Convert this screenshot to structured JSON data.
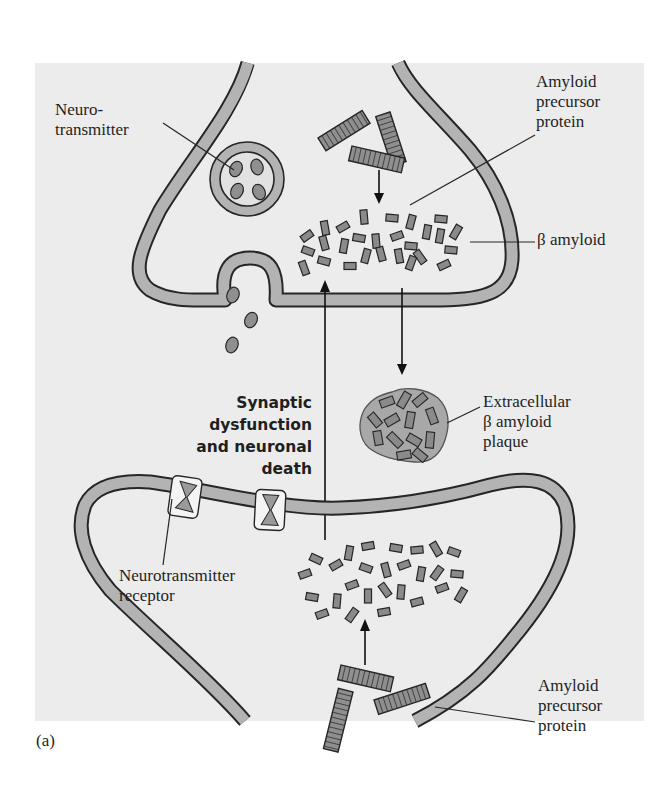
{
  "figure": {
    "panel_label": "(a)",
    "colors": {
      "background_panel": "#ececec",
      "page": "#ffffff",
      "membrane_fill": "#b3b3b3",
      "membrane_stroke": "#262626",
      "protein_fill": "#8f8f8f",
      "beta_fill": "#8a8a8a",
      "plaque_fill": "#a8a8a8",
      "receptor_fill": "#f4f4f4",
      "receptor_core": "#9a9a9a",
      "vesicle_inner": "#e2e2e2"
    },
    "labels": {
      "neurotransmitter": "Neuro-\ntransmitter",
      "app_top": "Amyloid\nprecursor\nprotein",
      "beta_amyloid": "β amyloid",
      "plaque": "Extracellular\nβ amyloid\nplaque",
      "synaptic": "Synaptic\ndysfunction\nand neuronal\ndeath",
      "receptor": "Neurotransmitter\nreceptor",
      "app_bottom": "Amyloid\nprecursor\nprotein"
    }
  }
}
